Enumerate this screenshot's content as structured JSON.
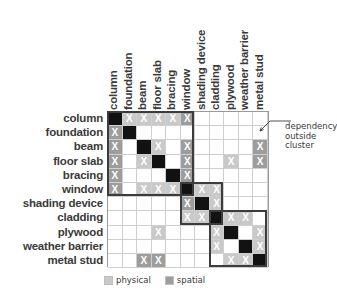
{
  "chart_data": {
    "type": "heatmap",
    "title": "",
    "xlabel": "",
    "ylabel": "",
    "categories": [
      "column",
      "foundation",
      "beam",
      "floor slab",
      "bracing",
      "window",
      "shading device",
      "cladding",
      "plywood",
      "weather barrier",
      "metal stud"
    ],
    "value_legend": {
      "0": "none",
      "1": "physical",
      "2": "spatial",
      "3": "diagonal"
    },
    "matrix": [
      [
        3,
        1,
        1,
        1,
        1,
        2,
        0,
        0,
        0,
        0,
        0
      ],
      [
        2,
        3,
        0,
        0,
        0,
        0,
        0,
        0,
        0,
        0,
        0
      ],
      [
        2,
        0,
        3,
        1,
        0,
        2,
        0,
        0,
        0,
        0,
        2
      ],
      [
        2,
        0,
        1,
        3,
        0,
        2,
        0,
        0,
        1,
        0,
        2
      ],
      [
        2,
        0,
        0,
        0,
        3,
        2,
        0,
        0,
        0,
        0,
        0
      ],
      [
        2,
        0,
        1,
        1,
        1,
        3,
        1,
        1,
        0,
        0,
        0
      ],
      [
        0,
        0,
        0,
        0,
        0,
        2,
        3,
        1,
        0,
        0,
        0
      ],
      [
        0,
        0,
        0,
        0,
        0,
        1,
        1,
        3,
        1,
        1,
        0
      ],
      [
        0,
        0,
        0,
        1,
        0,
        0,
        0,
        1,
        3,
        0,
        1
      ],
      [
        0,
        0,
        0,
        0,
        0,
        0,
        0,
        1,
        0,
        3,
        1
      ],
      [
        0,
        0,
        2,
        2,
        0,
        0,
        0,
        0,
        1,
        1,
        3
      ]
    ],
    "clusters": [
      {
        "name": "structure-cluster",
        "start": 0,
        "end": 5
      },
      {
        "name": "opening-cluster",
        "start": 5,
        "end": 7
      },
      {
        "name": "envelope-cluster",
        "start": 7,
        "end": 10
      }
    ],
    "annotations": [
      {
        "name": "dependency-outside-cluster",
        "text": "dependency outside cluster",
        "lines": [
          "dependency",
          "outside",
          "cluster"
        ],
        "target_row": "beam",
        "target_col": "metal stud"
      }
    ],
    "legend": {
      "position": "bottom-left",
      "entries": [
        {
          "label": "physical",
          "color": "#c9c9c9"
        },
        {
          "label": "spatial",
          "color": "#9d9d9d"
        }
      ]
    },
    "colors": {
      "diagonal": "#121212",
      "physical": "#c9c9c9",
      "spatial": "#9d9d9d",
      "empty": "#ffffff",
      "grid": "#cfcfcf",
      "cluster_border": "#3c3c3c",
      "text": "#3a3a3a"
    },
    "cell_marker": "X"
  },
  "legend": {
    "physical_label": "physical",
    "spatial_label": "spatial"
  },
  "annotation": {
    "line1": "dependency",
    "line2": "outside",
    "line3": "cluster"
  }
}
